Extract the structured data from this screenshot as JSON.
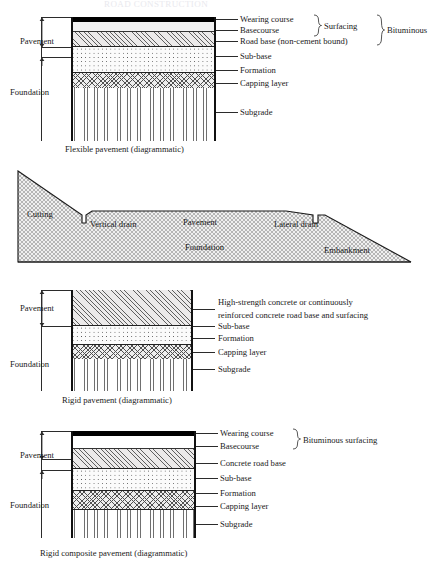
{
  "page": {
    "title_faint": "ROAD CONSTRUCTION",
    "ink": "#1a1a1a"
  },
  "figures": [
    {
      "id": "flexible-pavement",
      "caption": "Flexible pavement (diagrammatic)",
      "brackets": [
        {
          "name": "pavement",
          "label": "Pavement"
        },
        {
          "name": "foundation",
          "label": "Foundation"
        }
      ],
      "layers": [
        {
          "name": "wearing-course",
          "label": "Wearing course",
          "pattern": "black"
        },
        {
          "name": "basecourse",
          "label": "Basecourse",
          "pattern": "grey"
        },
        {
          "name": "road-base",
          "label": "Road base (non-cement bound)",
          "pattern": "diagonal"
        },
        {
          "name": "sub-base",
          "label": "Sub-base",
          "pattern": "dotted"
        },
        {
          "name": "formation",
          "label": "Formation",
          "pattern": "line"
        },
        {
          "name": "capping-layer",
          "label": "Capping layer",
          "pattern": "cross"
        },
        {
          "name": "subgrade",
          "label": "Subgrade",
          "pattern": "vertical"
        }
      ],
      "groups": [
        {
          "name": "surfacing",
          "label": "Surfacing"
        },
        {
          "name": "bituminous",
          "label": "Bituminous"
        }
      ]
    },
    {
      "id": "road-cross-section",
      "labels": [
        {
          "name": "cutting",
          "label": "Cutting"
        },
        {
          "name": "vertical-drain",
          "label": "Vertical drain"
        },
        {
          "name": "pavement",
          "label": "Pavement"
        },
        {
          "name": "lateral-drain",
          "label": "Lateral drain"
        },
        {
          "name": "foundation",
          "label": "Foundation"
        },
        {
          "name": "embankment",
          "label": "Embankment"
        }
      ]
    },
    {
      "id": "rigid-pavement",
      "caption": "Rigid pavement (diagrammatic)",
      "brackets": [
        {
          "name": "pavement",
          "label": "Pavement"
        },
        {
          "name": "foundation",
          "label": "Foundation"
        }
      ],
      "layers": [
        {
          "name": "concrete-road-base-surfacing",
          "label": "High-strength concrete or continuously",
          "label2": "reinforced concrete road base and surfacing",
          "pattern": "diagonal"
        },
        {
          "name": "sub-base",
          "label": "Sub-base",
          "pattern": "dotted"
        },
        {
          "name": "formation",
          "label": "Formation",
          "pattern": "line"
        },
        {
          "name": "capping-layer",
          "label": "Capping layer",
          "pattern": "cross"
        },
        {
          "name": "subgrade",
          "label": "Subgrade",
          "pattern": "vertical"
        }
      ]
    },
    {
      "id": "rigid-composite-pavement",
      "caption": "Rigid composite pavement (diagrammatic)",
      "brackets": [
        {
          "name": "pavement",
          "label": "Pavement"
        },
        {
          "name": "foundation",
          "label": "Foundation"
        }
      ],
      "layers": [
        {
          "name": "wearing-course",
          "label": "Wearing course",
          "pattern": "black"
        },
        {
          "name": "basecourse",
          "label": "Basecourse",
          "pattern": "plain"
        },
        {
          "name": "concrete-road-base",
          "label": "Concrete road base",
          "pattern": "diagonal"
        },
        {
          "name": "sub-base",
          "label": "Sub-base",
          "pattern": "dotted"
        },
        {
          "name": "formation",
          "label": "Formation",
          "pattern": "line"
        },
        {
          "name": "capping-layer",
          "label": "Capping layer",
          "pattern": "cross"
        },
        {
          "name": "subgrade",
          "label": "Subgrade",
          "pattern": "vertical"
        }
      ],
      "groups": [
        {
          "name": "bituminous-surfacing",
          "label": "Bituminous surfacing"
        }
      ]
    }
  ]
}
